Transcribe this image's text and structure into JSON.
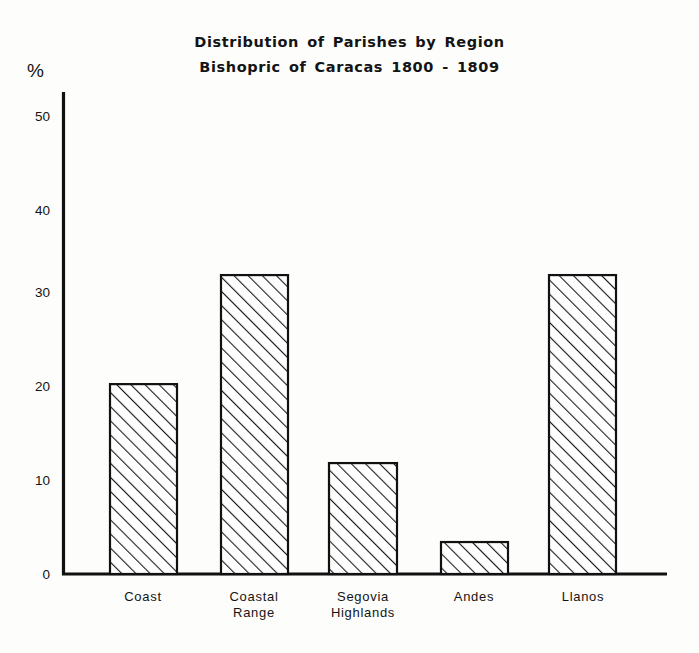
{
  "chart_data": {
    "type": "bar",
    "title": "Distribution of Parishes by Region",
    "subtitle": "Bishopric of Caracas 1800 - 1809",
    "title_lines": [
      "Distribution of Parishes by Region",
      "Bishopric of Caracas 1800 - 1809"
    ],
    "xlabel": "",
    "ylabel": "%",
    "categories": [
      "Coast",
      "Coastal Range",
      "Segovia Highlands",
      "Andes",
      "Llanos"
    ],
    "category_lines": [
      [
        "Coast"
      ],
      [
        "Coastal",
        "Range"
      ],
      [
        "Segovia",
        "Highlands"
      ],
      [
        "Andes"
      ],
      [
        "Llanos"
      ]
    ],
    "values": [
      20.2,
      31.8,
      11.8,
      3.4,
      31.8
    ],
    "ylim": [
      0,
      53
    ],
    "yticks": [
      0,
      10,
      20,
      30,
      40,
      50
    ],
    "ytick_labels": [
      "0",
      "10",
      "20",
      "30",
      "40",
      "50"
    ],
    "grid": false,
    "legend": null,
    "bar_fill": "diagonal-hatch",
    "colors": {
      "background": "#fdfdfb",
      "axis": "#111111",
      "bar_outline": "#111111",
      "hatch": "#1a1a1a",
      "text": "#141414"
    }
  },
  "axes": {
    "percent_symbol": "%"
  }
}
